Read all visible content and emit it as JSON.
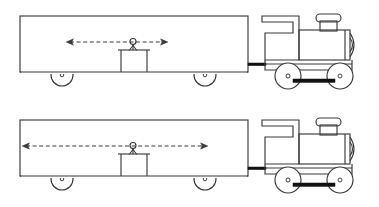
{
  "figure": {
    "type": "line-drawing",
    "background_color": "#ffffff",
    "ink_color": "#3a3a3a",
    "rod_color": "#111111",
    "width": 379,
    "height": 207
  },
  "panels": [
    {
      "id": "panel-top",
      "name": "top-train-diagram",
      "label": "",
      "offset_y": 0,
      "arrow": {
        "name": "short-double-arrow",
        "style": "dashed double-headed",
        "x_start": 66,
        "x_end": 168,
        "y": 42,
        "length": 102,
        "head_count": 2
      },
      "boxcar": {
        "name": "boxcar-body",
        "x": 20,
        "y": 16,
        "width": 228,
        "height": 56
      },
      "person": {
        "name": "stick-figure-person",
        "head_x": 133,
        "head_y": 42,
        "head_r": 3
      },
      "platform": {
        "name": "platform-table",
        "x": 120,
        "y": 50,
        "width": 28,
        "height": 22
      },
      "car_wheels": [
        {
          "cx": 62,
          "cy": 75,
          "r": 11
        },
        {
          "cx": 205,
          "cy": 75,
          "r": 11
        }
      ],
      "loco_wheels": [
        {
          "cx": 288,
          "cy": 76,
          "r": 13
        },
        {
          "cx": 340,
          "cy": 76,
          "r": 13
        }
      ]
    },
    {
      "id": "panel-bottom",
      "name": "bottom-train-diagram",
      "label": "",
      "offset_y": 104,
      "arrow": {
        "name": "long-double-arrow",
        "style": "dashed double-headed",
        "x_start": 22,
        "x_end": 208,
        "y": 42,
        "length": 186,
        "head_count": 2
      },
      "boxcar": {
        "name": "boxcar-body",
        "x": 20,
        "y": 16,
        "width": 228,
        "height": 56
      },
      "person": {
        "name": "stick-figure-person",
        "head_x": 133,
        "head_y": 42,
        "head_r": 3
      },
      "platform": {
        "name": "platform-table",
        "x": 120,
        "y": 50,
        "width": 28,
        "height": 22
      },
      "car_wheels": [
        {
          "cx": 62,
          "cy": 75,
          "r": 11
        },
        {
          "cx": 205,
          "cy": 75,
          "r": 11
        }
      ],
      "loco_wheels": [
        {
          "cx": 288,
          "cy": 76,
          "r": 13
        },
        {
          "cx": 340,
          "cy": 76,
          "r": 13
        }
      ]
    }
  ],
  "locomotive": {
    "name": "steam-locomotive",
    "parts": [
      "cab",
      "cab-roof",
      "cab-window",
      "boiler",
      "smokestack",
      "smokestack-cap",
      "smokebox-front",
      "footplate",
      "coupler",
      "connecting-rod",
      "driving-wheels"
    ],
    "wheel_count": 2,
    "smokestack_x": 325,
    "boiler_x": 305
  }
}
